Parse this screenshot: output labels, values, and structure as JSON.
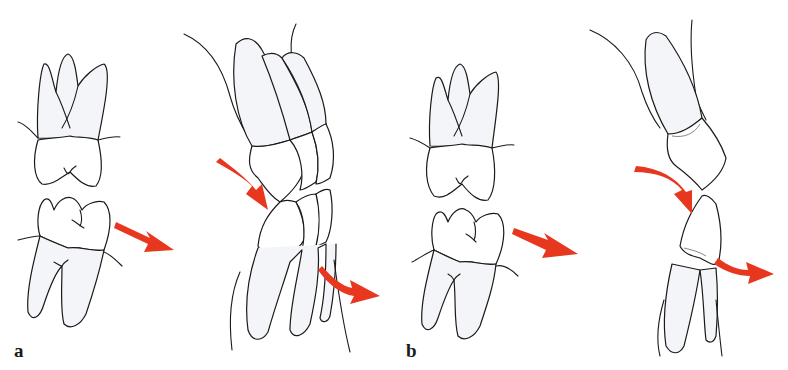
{
  "figure": {
    "panels": [
      {
        "id": "a",
        "label": "a",
        "description": "Molars in occlusion and lateral dentition view with red arrows showing force direction",
        "arrow_color": "#e8371f"
      },
      {
        "id": "b",
        "label": "b",
        "description": "Molars in occlusion and canine/premolar lateral view with curved red arrows",
        "arrow_color": "#e8371f"
      }
    ]
  }
}
